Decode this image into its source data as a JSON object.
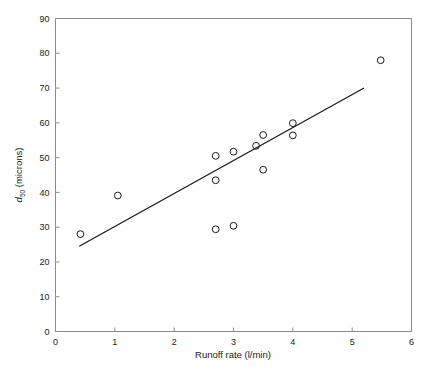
{
  "chart_data": {
    "type": "scatter",
    "title": "",
    "xlabel": "Runoff rate (l/min)",
    "ylabel": "d50 (microns)",
    "ylabel_parts": {
      "symbol": "d",
      "subscript": "50",
      "units": "(microns)"
    },
    "xlim": [
      0,
      6
    ],
    "ylim": [
      0,
      90
    ],
    "xticks": [
      0,
      1,
      2,
      3,
      4,
      5,
      6
    ],
    "yticks": [
      0,
      10,
      20,
      30,
      40,
      50,
      60,
      70,
      80,
      90
    ],
    "xticklabels": [
      "0",
      "1",
      "2",
      "3",
      "4",
      "5",
      "6"
    ],
    "yticklabels": [
      "0",
      "10",
      "20",
      "30",
      "40",
      "50",
      "60",
      "70",
      "80",
      "90"
    ],
    "grid": false,
    "legend": null,
    "marker": "open-circle",
    "marker_color": "#1a1a1a",
    "points": [
      {
        "x": 0.42,
        "y": 28.0
      },
      {
        "x": 1.05,
        "y": 39.1
      },
      {
        "x": 2.7,
        "y": 50.5
      },
      {
        "x": 2.7,
        "y": 43.5
      },
      {
        "x": 2.7,
        "y": 29.4
      },
      {
        "x": 3.0,
        "y": 51.7
      },
      {
        "x": 3.0,
        "y": 30.4
      },
      {
        "x": 3.38,
        "y": 53.4
      },
      {
        "x": 3.5,
        "y": 56.5
      },
      {
        "x": 3.5,
        "y": 46.5
      },
      {
        "x": 4.0,
        "y": 59.9
      },
      {
        "x": 4.0,
        "y": 56.4
      },
      {
        "x": 5.48,
        "y": 78.0
      }
    ],
    "fit_line": {
      "name": "linear regression",
      "x0": 0.4,
      "y0": 24.5,
      "x1": 5.2,
      "y1": 70.0,
      "color": "#1a1a1a"
    }
  },
  "style": {
    "frame_color": "#8c8c8c",
    "background": "#ffffff",
    "text_color": "#1a1a1a"
  }
}
